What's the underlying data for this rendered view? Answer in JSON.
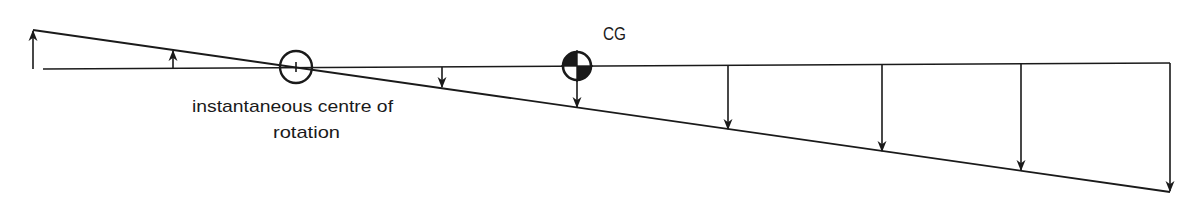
{
  "diagram": {
    "labels": {
      "icr_line1": "instantaneous centre of",
      "icr_line2": "rotation",
      "cg": "CG"
    },
    "colors": {
      "ink": "#1a1a1a",
      "background": "#ffffff"
    },
    "reference_line": {
      "x1": 43,
      "y1": 69,
      "x2": 1170,
      "y2": 63
    },
    "rotated_line": {
      "x1": 33,
      "y1": 30,
      "x2": 1170,
      "y2": 192
    },
    "instantaneous_centre": {
      "cx": 296,
      "cy": 67,
      "r": 16,
      "icon": "circle-with-tick-icon"
    },
    "cg_symbol": {
      "cx": 577,
      "cy": 66,
      "r": 14,
      "icon": "centre-of-gravity-icon"
    },
    "velocity_arrows": [
      {
        "x": 33,
        "from_y": 69,
        "to_y": 30,
        "direction": "up"
      },
      {
        "x": 173,
        "from_y": 68,
        "to_y": 50,
        "direction": "up"
      },
      {
        "x": 442,
        "from_y": 67,
        "to_y": 88,
        "direction": "down"
      },
      {
        "x": 577,
        "from_y": 80,
        "to_y": 108,
        "direction": "down"
      },
      {
        "x": 728,
        "from_y": 66,
        "to_y": 130,
        "direction": "down"
      },
      {
        "x": 882,
        "from_y": 65,
        "to_y": 152,
        "direction": "down"
      },
      {
        "x": 1021,
        "from_y": 64,
        "to_y": 171,
        "direction": "down"
      },
      {
        "x": 1170,
        "from_y": 63,
        "to_y": 192,
        "direction": "down"
      }
    ]
  }
}
